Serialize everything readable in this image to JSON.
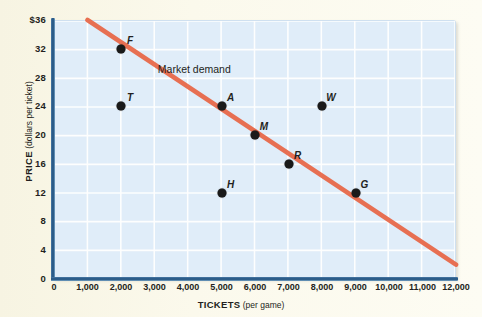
{
  "chart_data": {
    "type": "scatter",
    "title": "",
    "xlabel_bold": "TICKETS",
    "xlabel_unit": "(per game)",
    "ylabel_bold": "PRICE",
    "ylabel_unit": "(dollars per ticket)",
    "xlim": [
      0,
      12000
    ],
    "ylim": [
      0,
      36
    ],
    "grid": true,
    "xticks": [
      {
        "value": 0,
        "label": "0"
      },
      {
        "value": 1000,
        "label": "1,000"
      },
      {
        "value": 2000,
        "label": "2,000"
      },
      {
        "value": 3000,
        "label": "3,000"
      },
      {
        "value": 4000,
        "label": "4,000"
      },
      {
        "value": 5000,
        "label": "5,000"
      },
      {
        "value": 6000,
        "label": "6,000"
      },
      {
        "value": 7000,
        "label": "7,000"
      },
      {
        "value": 8000,
        "label": "8,000"
      },
      {
        "value": 9000,
        "label": "9,000"
      },
      {
        "value": 10000,
        "label": "10,000"
      },
      {
        "value": 11000,
        "label": "11,000"
      },
      {
        "value": 12000,
        "label": "12,000"
      }
    ],
    "yticks": [
      {
        "value": 36,
        "label": "$36"
      },
      {
        "value": 32,
        "label": "32"
      },
      {
        "value": 28,
        "label": "28"
      },
      {
        "value": 24,
        "label": "24"
      },
      {
        "value": 20,
        "label": "20"
      },
      {
        "value": 16,
        "label": "16"
      },
      {
        "value": 12,
        "label": "12"
      },
      {
        "value": 8,
        "label": "8"
      },
      {
        "value": 4,
        "label": "4"
      },
      {
        "value": 0,
        "label": "0"
      }
    ],
    "series": [
      {
        "name": "Market demand",
        "type": "line",
        "color": "#e8694a",
        "annotation": "Market demand",
        "endpoints": [
          {
            "x": 1000,
            "y": 36
          },
          {
            "x": 12000,
            "y": 2
          }
        ]
      },
      {
        "name": "points",
        "type": "scatter",
        "color": "#1a1a1a",
        "points": [
          {
            "label": "F",
            "x": 2000,
            "y": 32,
            "on_line": true
          },
          {
            "label": "T",
            "x": 2000,
            "y": 24,
            "on_line": false
          },
          {
            "label": "A",
            "x": 5000,
            "y": 24,
            "on_line": true
          },
          {
            "label": "M",
            "x": 6000,
            "y": 20,
            "on_line": true
          },
          {
            "label": "W",
            "x": 8000,
            "y": 24,
            "on_line": false
          },
          {
            "label": "H",
            "x": 5000,
            "y": 12,
            "on_line": false
          },
          {
            "label": "R",
            "x": 7000,
            "y": 16,
            "on_line": true
          },
          {
            "label": "G",
            "x": 9000,
            "y": 12,
            "on_line": true
          }
        ]
      }
    ],
    "colors": {
      "plot_background": "#e0edf9",
      "gridline": "#ffffff",
      "axis": "#1d4e7c",
      "demand_line": "#e8694a",
      "point": "#1a1a1a",
      "page_background": "#faf8e8"
    }
  }
}
